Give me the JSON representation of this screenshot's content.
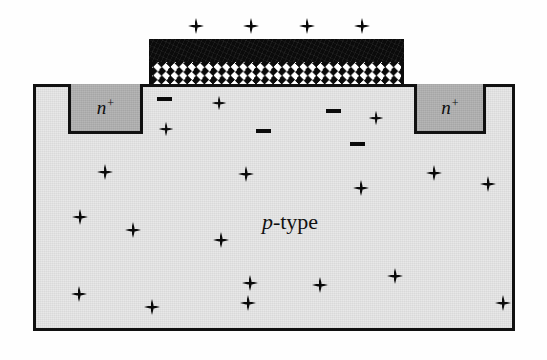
{
  "figure": {
    "name": "mosfet-cross-section",
    "background_color": "#fefefe"
  },
  "substrate": {
    "label": "p-type",
    "label_italic_part": "p",
    "label_roman_part": "-type",
    "fill_color": "#e8e8e8",
    "border_color": "#111111",
    "x": 33,
    "y": 84,
    "width": 482,
    "height": 247
  },
  "regions": [
    {
      "name": "source",
      "label": "n",
      "superscript": "+",
      "fill_color": "#b6b6b6",
      "x": 68,
      "y": 84,
      "width": 75,
      "height": 50
    },
    {
      "name": "drain",
      "label": "n",
      "superscript": "+",
      "fill_color": "#b6b6b6",
      "x": 414,
      "y": 84,
      "width": 72,
      "height": 50
    }
  ],
  "gate": {
    "metal": {
      "name": "gate-electrode",
      "color": "#0b0b0b",
      "x": 149,
      "y": 39,
      "width": 255,
      "height": 23
    },
    "oxide": {
      "name": "gate-oxide",
      "pattern": "white-diamond-checker",
      "color": "#0b0b0b",
      "pattern_color": "#ffffff",
      "x": 149,
      "y": 62,
      "width": 255,
      "height": 22
    }
  },
  "charges": {
    "gate_plus": [
      {
        "x": 196,
        "y": 26
      },
      {
        "x": 251,
        "y": 26
      },
      {
        "x": 307,
        "y": 26
      },
      {
        "x": 362,
        "y": 26
      }
    ],
    "inversion_minus": [
      {
        "x": 164,
        "y": 99
      },
      {
        "x": 263,
        "y": 131
      },
      {
        "x": 333,
        "y": 111
      },
      {
        "x": 357,
        "y": 144
      }
    ],
    "channel_plus": [
      {
        "x": 219,
        "y": 103
      },
      {
        "x": 166,
        "y": 129
      },
      {
        "x": 376,
        "y": 118
      }
    ],
    "bulk_plus": [
      {
        "x": 105,
        "y": 172
      },
      {
        "x": 246,
        "y": 174
      },
      {
        "x": 434,
        "y": 173
      },
      {
        "x": 361,
        "y": 188
      },
      {
        "x": 488,
        "y": 184
      },
      {
        "x": 80,
        "y": 217
      },
      {
        "x": 133,
        "y": 230
      },
      {
        "x": 221,
        "y": 240
      },
      {
        "x": 250,
        "y": 283
      },
      {
        "x": 395,
        "y": 276
      },
      {
        "x": 320,
        "y": 285
      },
      {
        "x": 79,
        "y": 294
      },
      {
        "x": 152,
        "y": 307
      },
      {
        "x": 248,
        "y": 303
      },
      {
        "x": 503,
        "y": 303
      }
    ]
  },
  "colors": {
    "substrate_fill": "#e8e8e8",
    "nwell_fill": "#b6b6b6",
    "outline": "#111111",
    "gate_black": "#0b0b0b",
    "oxide_white": "#ffffff"
  }
}
